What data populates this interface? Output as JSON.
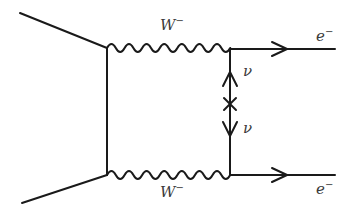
{
  "diagram": {
    "type": "feynman",
    "line_color": "#1a1a1a",
    "labels": {
      "w_top": {
        "base": "W",
        "sup": "−"
      },
      "w_bottom": {
        "base": "W",
        "sup": "−"
      },
      "e_top": {
        "base": "e",
        "sup": "−"
      },
      "e_bottom": {
        "base": "e",
        "sup": "−"
      },
      "nu_top": {
        "base": "ν"
      },
      "nu_bottom": {
        "base": "ν"
      }
    },
    "vertices": {
      "left_top": [
        107,
        48
      ],
      "left_bottom": [
        107,
        175
      ],
      "right_top": [
        230,
        49
      ],
      "right_bottom": [
        230,
        175
      ],
      "majorana_cross": [
        230,
        104
      ]
    },
    "edges": [
      {
        "kind": "fermion-plain",
        "from": [
          20,
          13
        ],
        "to": [
          107,
          48
        ]
      },
      {
        "kind": "fermion-plain",
        "from": [
          22,
          203
        ],
        "to": [
          107,
          175
        ]
      },
      {
        "kind": "fermion-plain",
        "from": [
          107,
          48
        ],
        "to": [
          107,
          175
        ]
      },
      {
        "kind": "boson-wavy",
        "label": "W−",
        "from": [
          107,
          48
        ],
        "to": [
          230,
          49
        ]
      },
      {
        "kind": "boson-wavy",
        "label": "W−",
        "from": [
          107,
          175
        ],
        "to": [
          230,
          175
        ]
      },
      {
        "kind": "fermion-arrow",
        "label": "e−",
        "from": [
          230,
          49
        ],
        "to": [
          335,
          49
        ]
      },
      {
        "kind": "fermion-arrow",
        "label": "e−",
        "from": [
          230,
          175
        ],
        "to": [
          335,
          175
        ]
      },
      {
        "kind": "neutrino-arrow-up",
        "label": "ν",
        "from": [
          230,
          104
        ],
        "to": [
          230,
          49
        ]
      },
      {
        "kind": "neutrino-arrow-down",
        "label": "ν",
        "from": [
          230,
          104
        ],
        "to": [
          230,
          175
        ]
      }
    ]
  }
}
